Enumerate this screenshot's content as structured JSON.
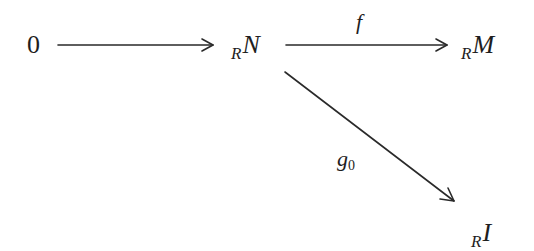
{
  "diagram": {
    "type": "commutative-diagram",
    "nodes": [
      {
        "id": "zero",
        "text": "0",
        "x": 34,
        "y": 45
      },
      {
        "id": "N",
        "subscript": "R",
        "text": "N",
        "x": 248,
        "y": 45
      },
      {
        "id": "M",
        "subscript": "R",
        "text": "M",
        "x": 482,
        "y": 45
      },
      {
        "id": "I",
        "subscript": "R",
        "text": "I",
        "x": 485,
        "y": 232
      }
    ],
    "edges": [
      {
        "from": "zero",
        "to": "N",
        "label": ""
      },
      {
        "from": "N",
        "to": "M",
        "label": "f"
      },
      {
        "from": "N",
        "to": "I",
        "label_main": "g",
        "label_sub": "0"
      }
    ],
    "colors": {
      "stroke": "#2a2a2a",
      "text": "#1e1e1e",
      "background": "#ffffff"
    }
  }
}
